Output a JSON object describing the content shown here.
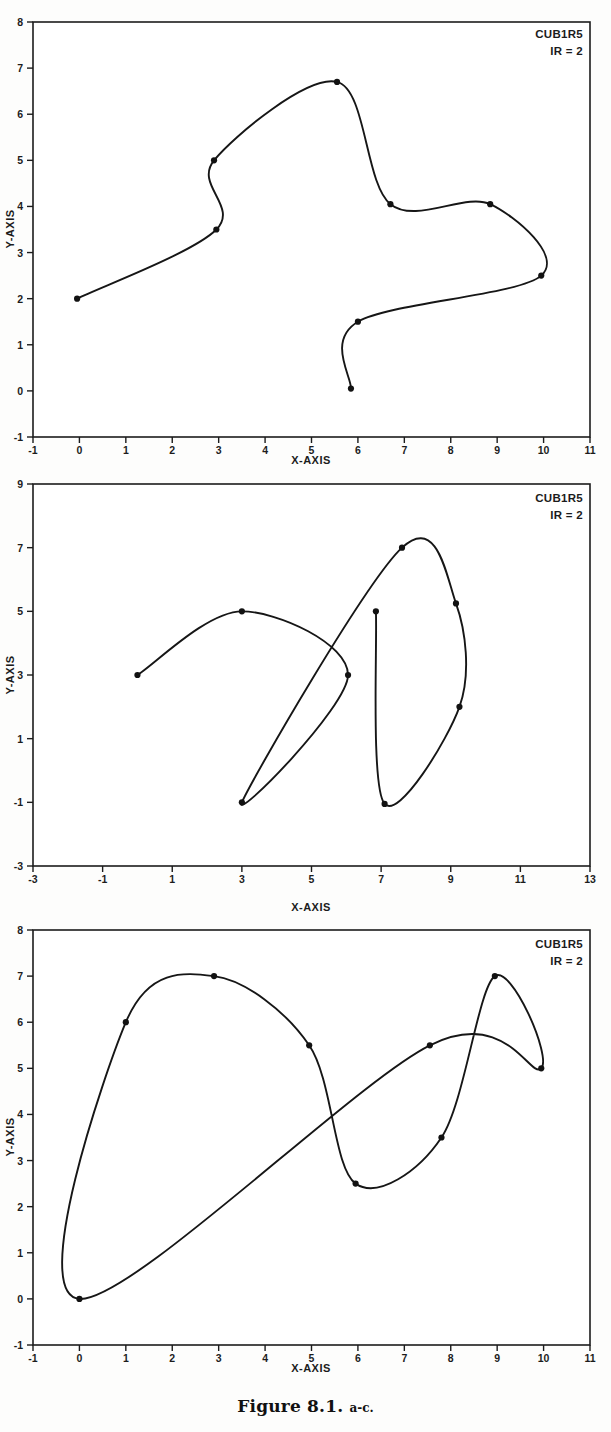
{
  "page": {
    "cut_header": "",
    "caption_main": "Figure 8.1.",
    "caption_sub": "a-c."
  },
  "panels": [
    {
      "id": "panel-a",
      "annotation_line1": "CUB1R5",
      "annotation_line2": "IR = 2",
      "xlabel": "X-AXIS",
      "ylabel": "Y-AXIS"
    },
    {
      "id": "panel-b",
      "annotation_line1": "CUB1R5",
      "annotation_line2": "IR = 2",
      "xlabel": "X-AXIS",
      "ylabel": "Y-AXIS"
    },
    {
      "id": "panel-c",
      "annotation_line1": "CUB1R5",
      "annotation_line2": "IR = 2",
      "xlabel": "X-AXIS",
      "ylabel": "Y-AXIS"
    }
  ],
  "chart_data": [
    {
      "type": "line",
      "title": "CUB1R5  IR = 2",
      "subtitle": "a",
      "xlabel": "X-AXIS",
      "ylabel": "Y-AXIS",
      "xlim": [
        -1,
        11
      ],
      "ylim": [
        -1,
        8
      ],
      "xticks": [
        -1,
        0,
        1,
        2,
        3,
        4,
        5,
        6,
        7,
        8,
        9,
        10,
        11
      ],
      "xticklabels": [
        "-1",
        "0",
        "1",
        "2",
        "3",
        "4",
        "5",
        "6",
        "7",
        "8",
        "9",
        "10",
        "11"
      ],
      "yticks": [
        -1,
        0,
        1,
        2,
        3,
        4,
        5,
        6,
        7,
        8
      ],
      "yticklabels": [
        "-1",
        "0",
        "1",
        "2",
        "3",
        "4",
        "5",
        "6",
        "7",
        "8"
      ],
      "grid": false,
      "legend": "none",
      "series": [
        {
          "name": "open parametric cubic spline",
          "marker": "filled-circle",
          "points": [
            [
              -0.05,
              2.0
            ],
            [
              2.95,
              3.5
            ],
            [
              2.9,
              5.0
            ],
            [
              5.55,
              6.7
            ],
            [
              6.7,
              4.05
            ],
            [
              8.85,
              4.05
            ],
            [
              9.95,
              2.5
            ],
            [
              6.0,
              1.5
            ],
            [
              5.85,
              0.05
            ]
          ]
        }
      ]
    },
    {
      "type": "line",
      "title": "CUB1R5  IR = 2",
      "subtitle": "b",
      "xlabel": "X-AXIS",
      "ylabel": "Y-AXIS",
      "xlim": [
        -3,
        13
      ],
      "ylim": [
        -3,
        9
      ],
      "xticks": [
        -3,
        -1,
        1,
        3,
        5,
        7,
        9,
        11,
        13
      ],
      "xticklabels": [
        "-3",
        "-1",
        "1",
        "3",
        "5",
        "7",
        "9",
        "11",
        "13"
      ],
      "yticks": [
        -3,
        -1,
        1,
        3,
        5,
        7,
        9
      ],
      "yticklabels": [
        "-3",
        "-1",
        "1",
        "3",
        "5",
        "7",
        "9"
      ],
      "grid": false,
      "legend": "none",
      "series": [
        {
          "name": "self-intersecting parametric cubic spline",
          "marker": "filled-circle",
          "points": [
            [
              0.0,
              3.0
            ],
            [
              3.0,
              5.0
            ],
            [
              6.05,
              3.0
            ],
            [
              3.0,
              -1.0
            ],
            [
              7.6,
              7.0
            ],
            [
              9.15,
              5.25
            ],
            [
              9.25,
              2.0
            ],
            [
              7.1,
              -1.05
            ],
            [
              6.85,
              5.0
            ]
          ]
        }
      ]
    },
    {
      "type": "line",
      "title": "CUB1R5  IR = 2",
      "subtitle": "c",
      "xlabel": "X-AXIS",
      "ylabel": "Y-AXIS",
      "xlim": [
        -1,
        11
      ],
      "ylim": [
        -1,
        8
      ],
      "xticks": [
        -1,
        0,
        1,
        2,
        3,
        4,
        5,
        6,
        7,
        8,
        9,
        10,
        11
      ],
      "xticklabels": [
        "-1",
        "0",
        "1",
        "2",
        "3",
        "4",
        "5",
        "6",
        "7",
        "8",
        "9",
        "10",
        "11"
      ],
      "yticks": [
        -1,
        0,
        1,
        2,
        3,
        4,
        5,
        6,
        7,
        8
      ],
      "yticklabels": [
        "-1",
        "0",
        "1",
        "2",
        "3",
        "4",
        "5",
        "6",
        "7",
        "8"
      ],
      "grid": false,
      "legend": "none",
      "series": [
        {
          "name": "closed parametric cubic spline loop",
          "marker": "filled-circle",
          "points": [
            [
              0.0,
              0.0
            ],
            [
              1.0,
              6.0
            ],
            [
              2.9,
              7.0
            ],
            [
              4.95,
              5.5
            ],
            [
              5.95,
              2.5
            ],
            [
              7.8,
              3.5
            ],
            [
              8.95,
              7.0
            ],
            [
              9.95,
              5.0
            ],
            [
              7.55,
              5.5
            ]
          ]
        }
      ]
    }
  ]
}
